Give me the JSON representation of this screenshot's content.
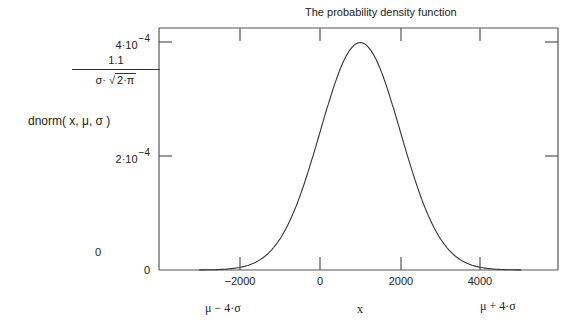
{
  "chart_data": {
    "type": "line",
    "title": "The probability density function",
    "xlabel": "x",
    "ylabel": "dnorm( x, μ, σ )",
    "ylabel_extra": {
      "numerator": "1.1",
      "denominator": "σ· √(2·π)",
      "zero": "0"
    },
    "x_extra_labels": {
      "left": "μ − 4·σ",
      "right": "μ + 4·σ"
    },
    "xlim": [
      -4000,
      6000
    ],
    "ylim": [
      0,
      0.00042
    ],
    "x_ticks": [
      -2000,
      0,
      2000,
      4000
    ],
    "x_tick_labels": [
      "−2000",
      "0",
      "2000",
      "4000"
    ],
    "y_ticks": [
      0,
      0.0002,
      0.0004
    ],
    "y_tick_labels": [
      {
        "base": "0",
        "exp": ""
      },
      {
        "base": "2·10",
        "exp": "−4"
      },
      {
        "base": "4·10",
        "exp": "−4"
      }
    ],
    "series": [
      {
        "name": "dnorm(x, μ, σ)",
        "mu": 1000,
        "sigma": 1000,
        "x_range": [
          -3000,
          5000
        ]
      }
    ],
    "grid": false,
    "legend": "none"
  }
}
